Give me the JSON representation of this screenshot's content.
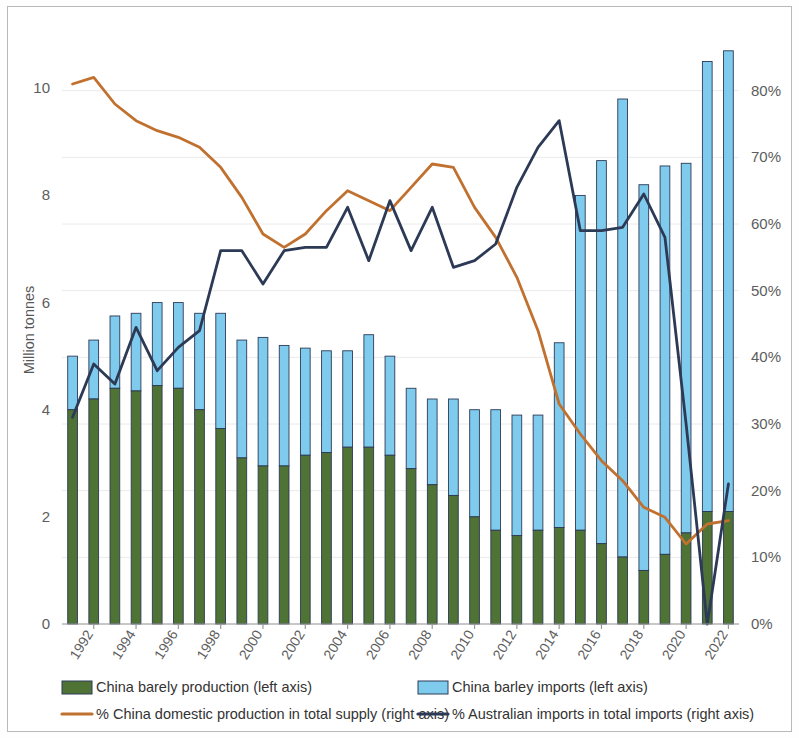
{
  "chart_data": {
    "type": "bar",
    "title": "",
    "subtitle": "",
    "xlabel": "",
    "ylabel": "Million tonnes",
    "y2label": "",
    "ylim": [
      0,
      11.2
    ],
    "y2lim": [
      0,
      90
    ],
    "yticks": [
      "0",
      "2",
      "4",
      "6",
      "8",
      "10"
    ],
    "ytick_values": [
      0,
      2,
      4,
      6,
      8,
      10
    ],
    "y2ticks": [
      "0%",
      "10%",
      "20%",
      "30%",
      "40%",
      "50%",
      "60%",
      "70%",
      "80%"
    ],
    "y2tick_values": [
      0,
      10,
      20,
      30,
      40,
      50,
      60,
      70,
      80
    ],
    "grid": true,
    "legend_position": "bottom",
    "stacked": true,
    "x": [
      1991,
      1992,
      1993,
      1994,
      1995,
      1996,
      1997,
      1998,
      1999,
      2000,
      2001,
      2002,
      2003,
      2004,
      2005,
      2006,
      2007,
      2008,
      2009,
      2010,
      2011,
      2012,
      2013,
      2014,
      2015,
      2016,
      2017,
      2018,
      2019,
      2020,
      2021,
      2022
    ],
    "categories": [
      "1991",
      "1992",
      "1993",
      "1994",
      "1995",
      "1996",
      "1997",
      "1998",
      "1999",
      "2000",
      "2001",
      "2002",
      "2003",
      "2004",
      "2005",
      "2006",
      "2007",
      "2008",
      "2009",
      "2010",
      "2011",
      "2012",
      "2013",
      "2014",
      "2015",
      "2016",
      "2017",
      "2018",
      "2019",
      "2020",
      "2021",
      "2022"
    ],
    "xtick_labels": [
      "1992",
      "1994",
      "1996",
      "1998",
      "2000",
      "2002",
      "2004",
      "2006",
      "2008",
      "2010",
      "2012",
      "2014",
      "2016",
      "2018",
      "2020",
      "2022"
    ],
    "xtick_values": [
      1992,
      1994,
      1996,
      1998,
      2000,
      2002,
      2004,
      2006,
      2008,
      2010,
      2012,
      2014,
      2016,
      2018,
      2020,
      2022
    ],
    "series": [
      {
        "name": "China barely production (left axis)",
        "axis": "left",
        "kind": "bar",
        "color": "#4f7235",
        "values": [
          4.0,
          4.2,
          4.4,
          4.35,
          4.45,
          4.4,
          4.0,
          3.65,
          3.1,
          2.95,
          2.95,
          3.15,
          3.2,
          3.3,
          3.3,
          3.15,
          2.9,
          2.6,
          2.4,
          2.0,
          1.75,
          1.65,
          1.75,
          1.8,
          1.75,
          1.5,
          1.25,
          1.0,
          1.3,
          1.7,
          2.1,
          2.1
        ]
      },
      {
        "name": "China barley imports (left axis)",
        "axis": "left",
        "kind": "bar",
        "color": "#7ecbee",
        "values": [
          1.0,
          1.1,
          1.35,
          1.45,
          1.55,
          1.6,
          1.8,
          2.15,
          2.2,
          2.4,
          2.25,
          2.0,
          1.9,
          1.8,
          2.1,
          1.85,
          1.5,
          1.6,
          1.8,
          2.0,
          2.25,
          2.25,
          2.15,
          3.45,
          6.25,
          7.15,
          8.55,
          7.2,
          7.25,
          6.9,
          8.4,
          8.6
        ]
      },
      {
        "name": "% China domestic production in total supply (right axis)",
        "axis": "right",
        "kind": "line",
        "color": "#c0712f",
        "values": [
          81.0,
          82.0,
          78.0,
          75.5,
          74.0,
          73.0,
          71.5,
          68.5,
          64.0,
          58.5,
          56.5,
          58.5,
          62.0,
          65.0,
          63.5,
          62.0,
          65.5,
          69.0,
          68.5,
          62.5,
          58.0,
          52.0,
          44.0,
          33.0,
          28.5,
          24.5,
          21.5,
          17.5,
          16.0,
          12.0,
          15.0,
          15.5
        ]
      },
      {
        "name": "% Australian imports in total imports (right axis)",
        "axis": "right",
        "kind": "line",
        "color": "#2d3a56",
        "values": [
          31.0,
          39.0,
          36.0,
          44.5,
          38.0,
          41.5,
          44.0,
          56.0,
          56.0,
          51.0,
          56.0,
          56.5,
          56.5,
          62.5,
          54.5,
          63.5,
          56.0,
          62.5,
          53.5,
          54.5,
          57.0,
          65.5,
          71.5,
          75.5,
          59.0,
          59.0,
          59.5,
          64.5,
          58.0,
          30.0,
          0.0,
          21.0
        ]
      }
    ]
  },
  "legend": {
    "items": [
      {
        "label": "China barely production (left axis)",
        "marker": "swatch",
        "color": "#4f7235",
        "border": "#2d3a56"
      },
      {
        "label": "China barley imports (left axis)",
        "marker": "swatch",
        "color": "#7ecbee",
        "border": "#2d3a56"
      },
      {
        "label": "% China domestic production in total supply (right axis)",
        "marker": "line",
        "color": "#c0712f",
        "border": "#c0712f"
      },
      {
        "label": "% Australian imports in total imports (right axis)",
        "marker": "line",
        "color": "#2d3a56",
        "border": "#2d3a56"
      }
    ]
  },
  "colors": {
    "production_green": "#4f7235",
    "imports_blue": "#7ecbee",
    "domestic_line_orange": "#c0712f",
    "australian_line_navy": "#2d3a56",
    "grid": "#eaeaea",
    "axis": "#9a9a9a",
    "frame": "#b9b9b9"
  }
}
